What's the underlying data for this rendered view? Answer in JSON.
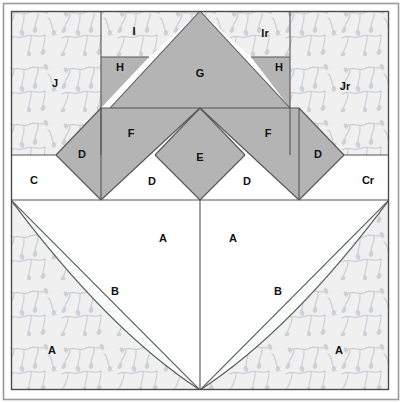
{
  "diagram": {
    "kind": "quilt-block-piecing-diagram",
    "width": 402,
    "height": 403,
    "colors": {
      "page_background": "#ffffff",
      "outer_border": "#9a9a9a",
      "inner_frame_stroke": "#4c4c4c",
      "print_fabric_fill": "#f0f0f0",
      "print_fabric_motif": "#c3c9cf",
      "solid_gray_fill": "#b4b4b4",
      "plain_white_fill": "#ffffff",
      "quilting_line": "#e4eaee",
      "piece_outline": "#555555",
      "label_text": "#111111"
    },
    "frame": {
      "outer_left": 3,
      "outer_top": 3,
      "outer_right": 398,
      "outer_bottom": 399,
      "inner_left": 11,
      "inner_top": 11,
      "inner_right": 389,
      "inner_bottom": 390
    },
    "geometry": {
      "center_x": 200,
      "band_c_top": 155,
      "band_c_bottom": 200,
      "row_hg_top": 57,
      "row_fg_split": 108,
      "col_i_left": 101,
      "col_i_right": 290,
      "d_left_vertex_x": 56,
      "d_right_vertex_x": 344,
      "g_apex": [
        200,
        11
      ],
      "e_apex": [
        200,
        108
      ],
      "e_bottom": [
        200,
        200
      ]
    },
    "pieces": [
      {
        "id": "J",
        "label": "J",
        "fabric": "print",
        "x": 55,
        "y": 84
      },
      {
        "id": "Jr",
        "label": "Jr",
        "fabric": "print",
        "x": 345,
        "y": 87
      },
      {
        "id": "I",
        "label": "I",
        "fabric": "print",
        "x": 134,
        "y": 32
      },
      {
        "id": "Ir",
        "label": "Ir",
        "fabric": "print",
        "x": 265,
        "y": 34
      },
      {
        "id": "H",
        "label": "H",
        "fabric": "solid",
        "x": 120,
        "y": 68
      },
      {
        "id": "Hr",
        "label": "H",
        "fabric": "solid",
        "x": 279,
        "y": 68
      },
      {
        "id": "G",
        "label": "G",
        "fabric": "solid",
        "x": 200,
        "y": 74
      },
      {
        "id": "F",
        "label": "F",
        "fabric": "solid",
        "x": 131,
        "y": 134
      },
      {
        "id": "Fr",
        "label": "F",
        "fabric": "solid",
        "x": 268,
        "y": 134
      },
      {
        "id": "D1",
        "label": "D",
        "fabric": "solid",
        "x": 82,
        "y": 155
      },
      {
        "id": "D4",
        "label": "D",
        "fabric": "solid",
        "x": 318,
        "y": 155
      },
      {
        "id": "D2",
        "label": "D",
        "fabric": "white",
        "x": 152,
        "y": 182
      },
      {
        "id": "D3",
        "label": "D",
        "fabric": "white",
        "x": 247,
        "y": 182
      },
      {
        "id": "E",
        "label": "E",
        "fabric": "solid",
        "x": 200,
        "y": 158
      },
      {
        "id": "C",
        "label": "C",
        "fabric": "white",
        "x": 34,
        "y": 181
      },
      {
        "id": "Cr",
        "label": "Cr",
        "fabric": "white",
        "x": 368,
        "y": 181
      },
      {
        "id": "A1",
        "label": "A",
        "fabric": "white",
        "x": 163,
        "y": 239
      },
      {
        "id": "A2",
        "label": "A",
        "fabric": "white",
        "x": 233,
        "y": 239
      },
      {
        "id": "A3",
        "label": "A",
        "fabric": "print",
        "x": 52,
        "y": 351
      },
      {
        "id": "A4",
        "label": "A",
        "fabric": "print",
        "x": 339,
        "y": 351
      },
      {
        "id": "B1",
        "label": "B",
        "fabric": "quilted-white",
        "x": 115,
        "y": 292
      },
      {
        "id": "B2",
        "label": "B",
        "fabric": "quilted-white",
        "x": 278,
        "y": 292
      }
    ]
  }
}
